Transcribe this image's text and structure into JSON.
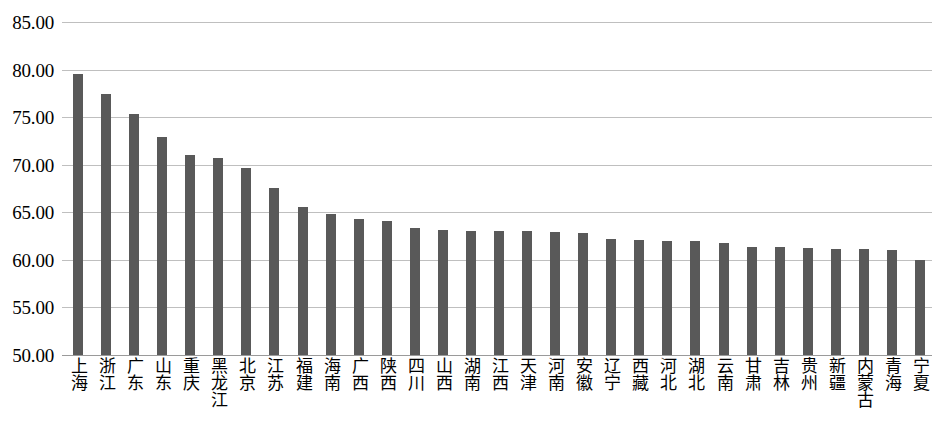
{
  "chart_data": {
    "type": "bar",
    "title": "",
    "subtitle": "",
    "xlabel": "",
    "ylabel": "",
    "ylim": [
      50.0,
      85.0
    ],
    "grid": true,
    "legend": false,
    "legend_position": "none",
    "bar_color": "#595959",
    "gridline_color": "#bfbfbf",
    "y_ticks": [
      "50.00",
      "55.00",
      "60.00",
      "65.00",
      "70.00",
      "75.00",
      "80.00",
      "85.00"
    ],
    "y_tick_values": [
      50,
      55,
      60,
      65,
      70,
      75,
      80,
      85
    ],
    "categories": [
      "上海",
      "浙江",
      "广东",
      "山东",
      "重庆",
      "黑龙江",
      "北京",
      "江苏",
      "福建",
      "海南",
      "广西",
      "陕西",
      "四川",
      "山西",
      "湖南",
      "江西",
      "天津",
      "河南",
      "安徽",
      "辽宁",
      "西藏",
      "河北",
      "湖北",
      "云南",
      "甘肃",
      "吉林",
      "贵州",
      "新疆",
      "内蒙古",
      "青海",
      "宁夏"
    ],
    "values": [
      79.5,
      77.4,
      75.3,
      72.9,
      71.0,
      70.7,
      69.7,
      67.6,
      65.6,
      64.8,
      64.3,
      64.1,
      63.3,
      63.1,
      63.0,
      63.0,
      63.0,
      62.9,
      62.8,
      62.2,
      62.1,
      62.0,
      62.0,
      61.8,
      61.4,
      61.4,
      61.3,
      61.1,
      61.1,
      61.0,
      60.0
    ]
  }
}
